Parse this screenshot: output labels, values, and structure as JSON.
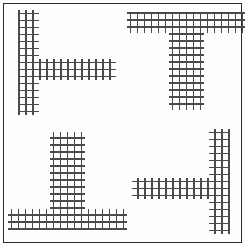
{
  "stimulus": {
    "kind": "navon-hierarchical-letter-array",
    "background_color": "#fefefe",
    "border_color": "#2b2b2b",
    "glyph_color": "#4a4a4a",
    "canvas": {
      "width": 245,
      "height": 246
    },
    "glyph_size_px": 7,
    "congruent": true,
    "figures": [
      {
        "id": "top-left",
        "position": "top-left",
        "global_letter": "T",
        "global_rotation_deg": 90,
        "global_orientation": "pointing-right",
        "global_symbol": "⊢",
        "local_letter": "T",
        "local_rotation_deg": 90,
        "local_symbol": "⊢",
        "stem": {
          "glyph_cols": 3,
          "glyph_rows": 15
        },
        "arm": {
          "glyph_cols": 11,
          "glyph_rows": 3
        },
        "arm_attach": "middle-right"
      },
      {
        "id": "top-right",
        "position": "top-right",
        "global_letter": "T",
        "global_rotation_deg": 0,
        "global_orientation": "upright",
        "global_symbol": "T",
        "local_letter": "T",
        "local_rotation_deg": 0,
        "local_symbol": "T",
        "stem": {
          "glyph_cols": 5,
          "glyph_rows": 11
        },
        "arm": {
          "glyph_cols": 17,
          "glyph_rows": 3
        },
        "arm_attach": "top-center"
      },
      {
        "id": "bottom-left",
        "position": "bottom-left",
        "global_letter": "T",
        "global_rotation_deg": 180,
        "global_orientation": "inverted",
        "global_symbol": "⊥",
        "local_letter": "T",
        "local_rotation_deg": 180,
        "local_symbol": "⊥",
        "stem": {
          "glyph_cols": 5,
          "glyph_rows": 11
        },
        "arm": {
          "glyph_cols": 17,
          "glyph_rows": 3
        },
        "arm_attach": "bottom-center"
      },
      {
        "id": "bottom-right",
        "position": "bottom-right",
        "global_letter": "T",
        "global_rotation_deg": 270,
        "global_orientation": "pointing-left",
        "global_symbol": "⊣",
        "local_letter": "T",
        "local_rotation_deg": 270,
        "local_symbol": "⊣",
        "stem": {
          "glyph_cols": 3,
          "glyph_rows": 15
        },
        "arm": {
          "glyph_cols": 11,
          "glyph_rows": 3
        },
        "arm_attach": "middle-left"
      }
    ]
  }
}
